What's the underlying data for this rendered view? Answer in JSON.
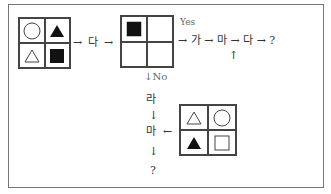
{
  "grid1": {
    "cells": [
      "circle-outline",
      "triangle-filled",
      "triangle-outline",
      "square-filled"
    ]
  },
  "grid2": {
    "cells": [
      "square-filled",
      "empty",
      "empty",
      "empty"
    ]
  },
  "grid3": {
    "cells": [
      "triangle-outline",
      "circle-outline",
      "triangle-filled",
      "square-outline"
    ]
  },
  "flow_top": {
    "arrow1": "→",
    "label_da": "다",
    "arrow2": "→",
    "yes_label": "Yes",
    "chain": "→ 가 → 마 → 다 → ?",
    "up_arrow": "↑"
  },
  "flow_down": {
    "no_label": "↓No",
    "ra": "라",
    "down1": "↓",
    "ma": "마",
    "left_arrow": "←",
    "down2": "↓",
    "question": "?"
  },
  "colors": {
    "stroke": "#444444",
    "fill": "#111111",
    "frame": "#777777"
  }
}
